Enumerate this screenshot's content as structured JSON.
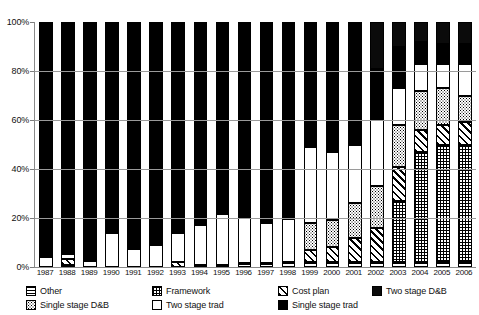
{
  "chart_data": {
    "type": "bar",
    "subtype": "stacked-percentage-bar",
    "title": "",
    "subtitle": "",
    "xlabel": "",
    "ylabel": "",
    "ylim": [
      0,
      100
    ],
    "yticks": [
      "0%",
      "20%",
      "40%",
      "60%",
      "80%",
      "100%"
    ],
    "ytick_values": [
      0,
      20,
      40,
      60,
      80,
      100
    ],
    "grid": true,
    "legend_position": "bottom",
    "units": "percent",
    "categories": [
      "1987",
      "1988",
      "1989",
      "1990",
      "1991",
      "1992",
      "1993",
      "1994",
      "1995",
      "1996",
      "1997",
      "1998",
      "1999",
      "2000",
      "2001",
      "2002",
      "2003",
      "2004",
      "2005",
      "2006"
    ],
    "series": [
      {
        "name": "Other",
        "swatch": "horizontal-lines",
        "values": [
          0,
          0.5,
          0,
          0,
          0,
          0,
          0,
          0.5,
          0.5,
          1.5,
          1.5,
          2,
          2,
          2,
          2,
          2,
          2,
          2,
          2,
          2
        ]
      },
      {
        "name": "Framework",
        "swatch": "crosshatch",
        "values": [
          0,
          0,
          0,
          0,
          0,
          0,
          0,
          0,
          0,
          0,
          0,
          0,
          0,
          0,
          0,
          0,
          25,
          45,
          48,
          48
        ]
      },
      {
        "name": "Cost plan",
        "swatch": "diagonal-stripes",
        "values": [
          0,
          2.5,
          0,
          0,
          0,
          0,
          2,
          0,
          0,
          0,
          0,
          0,
          5,
          6,
          10,
          14,
          14,
          9,
          8,
          9
        ]
      },
      {
        "name": "Single stage D&B",
        "swatch": "dotted",
        "values": [
          0,
          0,
          0,
          0,
          0,
          0,
          0,
          0,
          0,
          0,
          0,
          0,
          11,
          11,
          14,
          17,
          17,
          16,
          15,
          11
        ]
      },
      {
        "name": "Two stage trad",
        "swatch": "white",
        "values": [
          4,
          2,
          2.5,
          14,
          7.5,
          9,
          12,
          16.5,
          21,
          19,
          16.5,
          17.5,
          31,
          28,
          24,
          27,
          15,
          11,
          10,
          13
        ]
      },
      {
        "name": "Single stage trad",
        "swatch": "solid-black",
        "values": [
          96,
          95,
          97.5,
          86,
          92.5,
          91,
          86,
          83,
          78.5,
          79.5,
          82,
          80.5,
          51,
          53,
          50,
          21,
          17,
          9,
          8,
          8
        ]
      },
      {
        "name": "Two stage D&B",
        "swatch": "dark-square",
        "values": [
          0,
          0,
          0,
          0,
          0,
          0,
          0,
          0,
          0,
          0,
          0,
          0,
          0,
          0,
          0,
          19,
          10,
          8,
          9,
          9
        ]
      }
    ]
  },
  "legend": {
    "row1": [
      {
        "label": "Other",
        "swatch": "horizontal-lines"
      },
      {
        "label": "Framework",
        "swatch": "crosshatch"
      },
      {
        "label": "Cost plan",
        "swatch": "diagonal-stripes"
      },
      {
        "label": "Two stage D&B",
        "swatch": "dark-square"
      }
    ],
    "row2": [
      {
        "label": "Single stage D&B",
        "swatch": "dotted"
      },
      {
        "label": "Two stage trad",
        "swatch": "white"
      },
      {
        "label": "Single stage trad",
        "swatch": "solid-black"
      }
    ]
  },
  "colors": {
    "ink": "#000000",
    "axis": "#8a8a8a",
    "grid": "#9a9a9a",
    "background": "#ffffff",
    "solid_black": "#000000",
    "two_stage_db": "#0b0b0b"
  }
}
